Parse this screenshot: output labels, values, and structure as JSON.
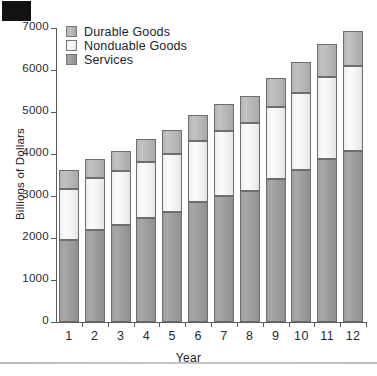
{
  "chart_data": {
    "type": "bar",
    "subtype": "stacked-bar",
    "title": "",
    "xlabel": "Year",
    "ylabel": "Billions of Dollars",
    "categories": [
      "1",
      "2",
      "3",
      "4",
      "5",
      "6",
      "7",
      "8",
      "9",
      "10",
      "11",
      "12"
    ],
    "ylim": [
      0,
      7000
    ],
    "yticks": [
      0,
      1000,
      2000,
      3000,
      4000,
      5000,
      6000,
      7000
    ],
    "ytick_labels": [
      "0",
      "1000",
      "2000",
      "3000",
      "4000",
      "5000",
      "6000",
      "7000"
    ],
    "grid": false,
    "legend_position": "upper-left",
    "stack_order_bottom_to_top": [
      "Services",
      "Nondurable Goods",
      "Durable Goods"
    ],
    "series": [
      {
        "name": "Services",
        "color": "#9d9d9d",
        "values": [
          1960,
          2180,
          2310,
          2480,
          2620,
          2850,
          3010,
          3110,
          3410,
          3610,
          3870,
          4060
        ]
      },
      {
        "name": "Nondurable Goods",
        "color": "#f4f4f4",
        "values": [
          1210,
          1240,
          1290,
          1330,
          1380,
          1450,
          1530,
          1620,
          1710,
          1840,
          1960,
          2030
        ]
      },
      {
        "name": "Durable Goods",
        "color": "#b8b8b8",
        "values": [
          460,
          450,
          470,
          540,
          580,
          630,
          640,
          660,
          690,
          740,
          780,
          830
        ]
      }
    ],
    "totals": [
      3630,
      3870,
      4070,
      4350,
      4580,
      4930,
      5180,
      5390,
      5810,
      6190,
      6610,
      6920
    ]
  },
  "legend": {
    "items": [
      {
        "label": "Durable Goods",
        "color": "#b8b8b8"
      },
      {
        "label": "Nonduable Goods",
        "color": "#f4f4f4"
      },
      {
        "label": "Services",
        "color": "#9d9d9d"
      }
    ]
  },
  "axes": {
    "y_title": "Billions of Dollars",
    "x_title": "Year"
  }
}
